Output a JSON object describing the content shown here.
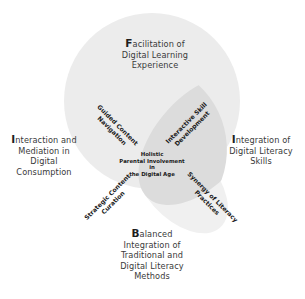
{
  "diagram": {
    "center": {
      "line1": "Holistic",
      "line2": "Parental Involvement",
      "line3": "in",
      "line4": "the Digital Age"
    },
    "outer_labels": {
      "top": {
        "cap": "F",
        "rest": "acilitation of",
        "line2": "Digital Learning",
        "line3": "Experience"
      },
      "left": {
        "cap": "I",
        "rest": "nteraction and",
        "line2": "Mediation in",
        "line3": "Digital",
        "line4": "Consumption"
      },
      "right": {
        "cap": "I",
        "rest": "ntegration of",
        "line2": "Digital Literacy",
        "line3": "Skills"
      },
      "bottom": {
        "cap": "B",
        "rest": "alanced",
        "line2": "Integration of",
        "line3": "Traditional and",
        "line4": "Digital Literacy",
        "line5": "Methods"
      }
    },
    "inner_labels": {
      "upper_left": {
        "line1": "Guided Content",
        "line2": "Navigation"
      },
      "upper_right": {
        "line1": "Interactive Skill",
        "line2": "Development"
      },
      "lower_left": {
        "line1": "Strategic Content",
        "line2": "Curation"
      },
      "lower_right": {
        "line1": "Synergy of Literacy",
        "line2": "Practices"
      }
    },
    "colors": {
      "circle": "#ececec",
      "lens_dark": "#d9d9d9",
      "lens_light": "#f0f0f0",
      "text": "#2a2a2a"
    }
  }
}
